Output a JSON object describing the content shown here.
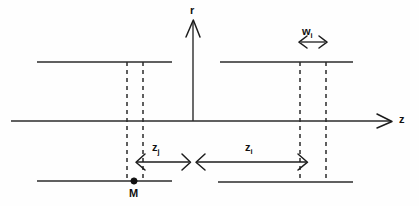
{
  "figure": {
    "kind": "technical-line-diagram",
    "background_color": "#fefefe",
    "line_color": "#2b2b2b"
  },
  "axes": {
    "vertical": {
      "label": "r",
      "arrow_direction": "up",
      "x": 193,
      "y_top": 20,
      "y_bottom": 121
    },
    "horizontal": {
      "label": "z",
      "arrow_direction": "right",
      "y": 121,
      "x_left": 11,
      "x_right": 392
    }
  },
  "plates": [
    {
      "name": "upper-left-plate",
      "x1": 37,
      "x2": 172,
      "y": 62
    },
    {
      "name": "upper-right-plate",
      "x1": 220,
      "x2": 353,
      "y": 62
    },
    {
      "name": "lower-left-plate",
      "x1": 37,
      "x2": 172,
      "y": 181
    },
    {
      "name": "lower-right-plate",
      "x1": 218,
      "x2": 353,
      "y": 182
    }
  ],
  "dashed_markers": [
    {
      "name": "dash-left-inner",
      "x": 127,
      "y1": 62,
      "y2": 181
    },
    {
      "name": "dash-left-outer",
      "x": 143,
      "y1": 62,
      "y2": 181
    },
    {
      "name": "dash-right-inner",
      "x": 300,
      "y1": 62,
      "y2": 182
    },
    {
      "name": "dash-right-outer",
      "x": 326,
      "y1": 62,
      "y2": 182
    }
  ],
  "dimensions": [
    {
      "name": "width-wi",
      "label": "w",
      "subscript": "i",
      "arrow_type": "double",
      "y": 42,
      "x1": 299,
      "x2": 327
    },
    {
      "name": "distance-zj",
      "label": "z",
      "subscript": "j",
      "arrow_type": "double",
      "y": 162,
      "x1": 136,
      "x2": 190
    },
    {
      "name": "distance-zi",
      "label": "z",
      "subscript": "i",
      "arrow_type": "double",
      "y": 162,
      "x1": 196,
      "x2": 307
    }
  ],
  "points": [
    {
      "name": "point-M",
      "label": "M",
      "x": 134,
      "y": 181
    }
  ]
}
